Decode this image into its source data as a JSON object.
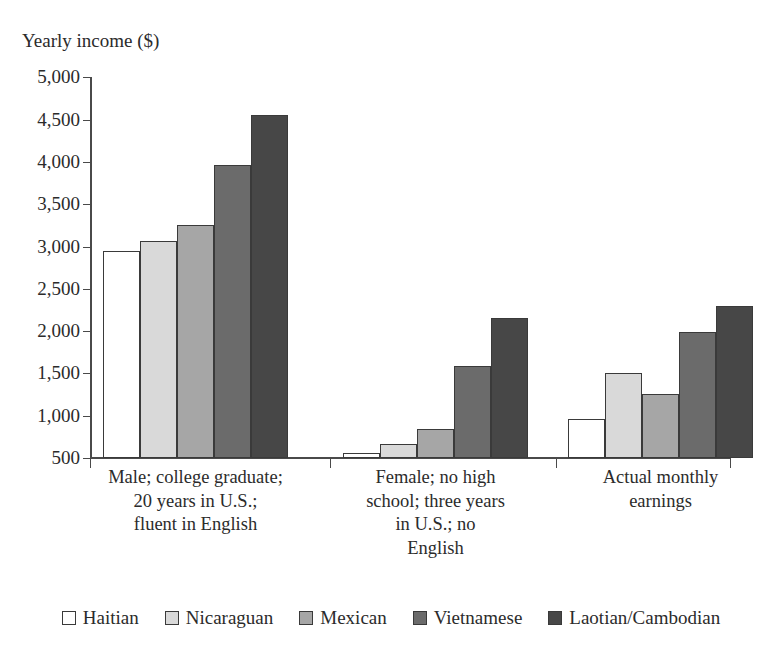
{
  "chart_data": {
    "type": "bar",
    "title": "",
    "ylabel": "Yearly income ($)",
    "xlabel": "",
    "ylim": [
      500,
      5000
    ],
    "ytick_step": 500,
    "grid": false,
    "legend_position": "bottom",
    "ytick_labels": [
      "5,000",
      "4,500",
      "4,000",
      "3,500",
      "3,000",
      "2,500",
      "2,000",
      "1,500",
      "1,000",
      "500"
    ],
    "ytick_values": [
      5000,
      4500,
      4000,
      3500,
      3000,
      2500,
      2000,
      1500,
      1000,
      500
    ],
    "categories": [
      "Male; college graduate;\n20 years in U.S.;\nfluent in English",
      "Female; no high\nschool; three years\nin U.S.; no\nEnglish",
      "Actual monthly\nearnings"
    ],
    "category_lines": [
      [
        "Male; college graduate;",
        "20 years in U.S.;",
        "fluent in English"
      ],
      [
        "Female; no high",
        "school; three years",
        "in U.S.; no",
        "English"
      ],
      [
        "Actual monthly",
        "earnings"
      ]
    ],
    "series": [
      {
        "name": "Haitian",
        "color": "#ffffff",
        "values": [
          2950,
          560,
          960
        ]
      },
      {
        "name": "Nicaraguan",
        "color": "#d9d9d9",
        "values": [
          3060,
          670,
          1500
        ]
      },
      {
        "name": "Mexican",
        "color": "#a6a6a6",
        "values": [
          3250,
          840,
          1260
        ]
      },
      {
        "name": "Vietnamese",
        "color": "#6b6b6b",
        "values": [
          3960,
          1590,
          1990
        ]
      },
      {
        "name": "Laotian/Cambodian",
        "color": "#474747",
        "values": [
          4560,
          2160,
          2300
        ]
      }
    ]
  },
  "legend": {
    "entries": [
      {
        "label": "Haitian",
        "swatch": "#ffffff"
      },
      {
        "label": "Nicaraguan",
        "swatch": "#d9d9d9"
      },
      {
        "label": "Mexican",
        "swatch": "#a6a6a6"
      },
      {
        "label": "Vietnamese",
        "swatch": "#6b6b6b"
      },
      {
        "label": "Laotian/Cambodian",
        "swatch": "#474747"
      }
    ]
  }
}
